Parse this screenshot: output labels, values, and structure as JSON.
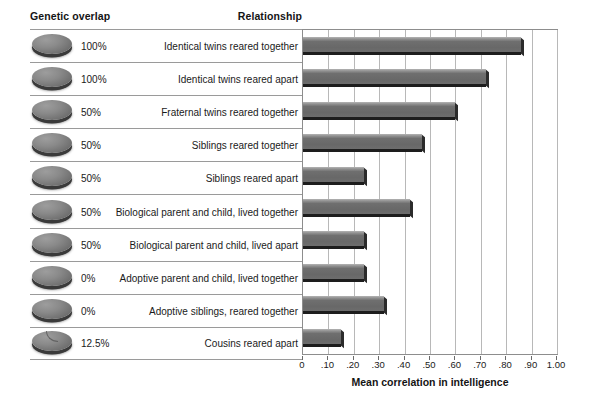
{
  "header": {
    "genetic_overlap": "Genetic overlap",
    "relationship": "Relationship"
  },
  "chart_data": {
    "type": "bar",
    "orientation": "horizontal",
    "title": "",
    "xlabel": "Mean correlation in intelligence",
    "ylabel": "",
    "xlim": [
      0,
      1.0
    ],
    "grid": true,
    "legend": null,
    "xticks": [
      0,
      0.1,
      0.2,
      0.3,
      0.4,
      0.5,
      0.6,
      0.7,
      0.8,
      0.9,
      1.0
    ],
    "xticklabels": [
      "0",
      ".10",
      ".20",
      ".30",
      ".40",
      ".50",
      ".60",
      ".70",
      ".80",
      ".90",
      "1.00"
    ],
    "categories": [
      "Identical twins reared together",
      "Identical twins reared apart",
      "Fraternal twins reared together",
      "Siblings reared together",
      "Siblings reared apart",
      "Biological parent and child, lived together",
      "Biological parent and child, lived apart",
      "Adoptive parent and child, lived together",
      "Adoptive siblings, reared together",
      "Cousins reared apart"
    ],
    "values": [
      0.86,
      0.72,
      0.6,
      0.47,
      0.24,
      0.42,
      0.24,
      0.24,
      0.32,
      0.15
    ],
    "genetic_overlap": [
      "100%",
      "100%",
      "50%",
      "50%",
      "50%",
      "50%",
      "50%",
      "0%",
      "0%",
      "12.5%"
    ],
    "bar_color": "#6f6f6f",
    "grid_color": "#b8b8b8"
  },
  "rows": [
    {
      "overlap": "100%",
      "relationship": "Identical twins reared together",
      "value": 0.86,
      "icon": "genetic-disc-icon"
    },
    {
      "overlap": "100%",
      "relationship": "Identical twins reared apart",
      "value": 0.72,
      "icon": "genetic-disc-icon"
    },
    {
      "overlap": "50%",
      "relationship": "Fraternal twins reared together",
      "value": 0.6,
      "icon": "genetic-disc-icon"
    },
    {
      "overlap": "50%",
      "relationship": "Siblings reared together",
      "value": 0.47,
      "icon": "genetic-disc-icon"
    },
    {
      "overlap": "50%",
      "relationship": "Siblings reared apart",
      "value": 0.24,
      "icon": "genetic-disc-icon"
    },
    {
      "overlap": "50%",
      "relationship": "Biological parent and child, lived together",
      "value": 0.42,
      "icon": "genetic-disc-icon"
    },
    {
      "overlap": "50%",
      "relationship": "Biological parent and child, lived apart",
      "value": 0.24,
      "icon": "genetic-disc-icon"
    },
    {
      "overlap": "0%",
      "relationship": "Adoptive parent and child, lived together",
      "value": 0.24,
      "icon": "genetic-disc-icon"
    },
    {
      "overlap": "0%",
      "relationship": "Adoptive siblings, reared together",
      "value": 0.32,
      "icon": "genetic-disc-icon"
    },
    {
      "overlap": "12.5%",
      "relationship": "Cousins reared apart",
      "value": 0.15,
      "icon": "genetic-disc-wedge-icon"
    }
  ]
}
